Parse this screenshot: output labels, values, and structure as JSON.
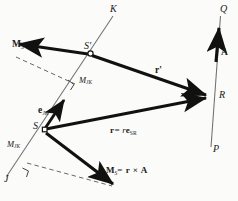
{
  "figure": {
    "name": "moment-of-force-about-a-line-diagram",
    "width": 238,
    "height": 201,
    "background": "#fbfbf9",
    "ink": "#111111",
    "thin_line": "#6f6f6f"
  },
  "points": [
    {
      "id": "K",
      "label": "K",
      "x": 112,
      "y": 10,
      "role": "line-JK-upper-end"
    },
    {
      "id": "J",
      "label": "J",
      "x": 6,
      "y": 180,
      "role": "line-JK-lower-end"
    },
    {
      "id": "Q",
      "label": "Q",
      "x": 222,
      "y": 10,
      "role": "line-PQ-upper-end"
    },
    {
      "id": "P",
      "label": "P",
      "x": 214,
      "y": 150,
      "role": "line-PQ-lower-end"
    },
    {
      "id": "S",
      "label": "S",
      "x": 41,
      "y": 128,
      "role": "moment-center-lower"
    },
    {
      "id": "Sp",
      "label": "S'",
      "x": 89,
      "y": 51,
      "role": "moment-center-upper"
    },
    {
      "id": "R",
      "label": "R",
      "x": 214,
      "y": 96,
      "role": "force-application-point"
    }
  ],
  "vectors": [
    {
      "id": "A",
      "label": "A",
      "kind": "force",
      "from": "on-line-PQ",
      "to": "upward"
    },
    {
      "id": "r",
      "label": "r",
      "kind": "position",
      "from": "S",
      "to": "R"
    },
    {
      "id": "rprime",
      "label": "r'",
      "kind": "position",
      "from": "S'",
      "to": "R"
    },
    {
      "id": "e_JK",
      "label": "e",
      "sub": "JK",
      "kind": "unit-vector",
      "along": "line-JK"
    },
    {
      "id": "M_S",
      "label": "M",
      "sub": "S",
      "kind": "moment",
      "at": "S"
    },
    {
      "id": "M_Sp",
      "label": "M",
      "sub": "S'",
      "kind": "moment",
      "at": "S'"
    }
  ],
  "labels": {
    "K": "K",
    "J": "J",
    "Q": "Q",
    "P": "P",
    "S": "S",
    "S_prime": "S'",
    "R": "R",
    "A": "A",
    "r_prime": "r'",
    "M_S_prime_base": "M",
    "M_S_prime_sub": "S'",
    "M_S_base": "M",
    "M_S_sub": "S",
    "M_S_equation_rhs": "= r × A",
    "M_JK_base": "M",
    "M_JK_sub": "JK",
    "M_JK_upper_base": "M",
    "M_JK_upper_sub": "JK",
    "e_JK_base": "e",
    "e_JK_sub": "JK",
    "r_eq_lhs": "r",
    "r_eq_mid": "= r",
    "r_eq_rhs_base": "e",
    "r_eq_rhs_sub": "SR"
  },
  "annotations": {
    "right_angle_upper": "perpendicular-mark-upper",
    "right_angle_lower": "perpendicular-mark-lower",
    "dashed_upper": "projection-construction-upper",
    "dashed_lower": "projection-construction-lower"
  }
}
